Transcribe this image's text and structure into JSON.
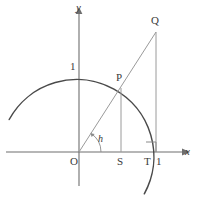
{
  "figure": {
    "type": "geometry-diagram",
    "background_color": "#ffffff",
    "stroke_color": "#4a4a4a",
    "thin_stroke_color": "#8f8f8f",
    "label_color": "#3a3a3a",
    "axes": {
      "x_axis_label": "x",
      "y_axis_label": "y",
      "origin_label": "O",
      "x_axis_y_px": 152,
      "y_axis_x_px": 79,
      "x_axis_from_px": 6,
      "x_axis_to_px": 190,
      "y_axis_from_px": 9,
      "y_axis_to_px": 186
    },
    "labels": [
      {
        "name": "y-axis-label",
        "text": "y",
        "x": 76,
        "y": 2,
        "italic": true,
        "small": false
      },
      {
        "name": "x-axis-label",
        "text": "x",
        "x": 185,
        "y": 146,
        "italic": true,
        "small": false
      },
      {
        "name": "origin-label",
        "text": "O",
        "x": 70,
        "y": 156,
        "italic": false,
        "small": false
      },
      {
        "name": "unit-y-label",
        "text": "1",
        "x": 70,
        "y": 61,
        "italic": false,
        "small": false
      },
      {
        "name": "point-p-label",
        "text": "P",
        "x": 116,
        "y": 72,
        "italic": false,
        "small": false
      },
      {
        "name": "point-q-label",
        "text": "Q",
        "x": 151,
        "y": 15,
        "italic": false,
        "small": false
      },
      {
        "name": "point-s-label",
        "text": "S",
        "x": 117,
        "y": 156,
        "italic": false,
        "small": false
      },
      {
        "name": "point-t-label",
        "text": "T",
        "x": 144,
        "y": 156,
        "italic": false,
        "small": false
      },
      {
        "name": "unit-x-label",
        "text": "1",
        "x": 156,
        "y": 156,
        "italic": false,
        "small": false
      },
      {
        "name": "angle-h-label",
        "text": "h",
        "x": 98,
        "y": 134,
        "italic": true,
        "small": true
      }
    ],
    "circle": {
      "center_x_px": 79,
      "center_y_px": 152,
      "radius_px": 77,
      "arc_start_deg": 155,
      "arc_end_deg": -32
    },
    "ray": {
      "from_x_px": 79,
      "from_y_px": 152,
      "to_x_px": 156,
      "to_y_px": 32
    },
    "segments": [
      {
        "name": "segment-ps",
        "x1": 121,
        "y1": 89,
        "x2": 121,
        "y2": 152
      },
      {
        "name": "segment-qt",
        "x1": 156,
        "y1": 32,
        "x2": 156,
        "y2": 152
      }
    ],
    "right_angle_marker": {
      "name": "right-angle-marker",
      "x": 156,
      "y": 152,
      "size": 10
    },
    "angle_arc": {
      "name": "angle-arc-h",
      "center_x_px": 79,
      "center_y_px": 152,
      "radius_px": 22
    }
  }
}
